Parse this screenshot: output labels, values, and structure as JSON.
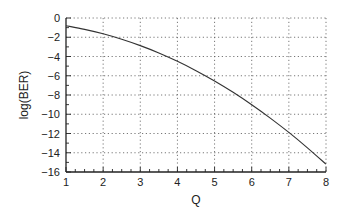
{
  "chart_data": {
    "type": "line",
    "title": "",
    "xlabel": "Q",
    "ylabel": "log(BER)",
    "xlim": [
      1,
      8
    ],
    "ylim": [
      -16,
      0
    ],
    "xticks": [
      1,
      2,
      3,
      4,
      5,
      6,
      7,
      8
    ],
    "yticks": [
      0,
      -2,
      -4,
      -6,
      -8,
      -10,
      -12,
      -14,
      -16
    ],
    "xtick_labels": [
      "1",
      "2",
      "3",
      "4",
      "5",
      "6",
      "7",
      "8"
    ],
    "ytick_labels": [
      "0",
      "−2",
      "−4",
      "−6",
      "−8",
      "−10",
      "−12",
      "−14",
      "−16"
    ],
    "grid": true,
    "grid_style": "dotted",
    "legend": null,
    "series": [
      {
        "name": "log(BER) vs Q",
        "color": "#333333",
        "x": [
          1,
          1.5,
          2,
          2.5,
          3,
          3.5,
          4,
          4.5,
          5,
          5.5,
          6,
          6.5,
          7,
          7.5,
          8
        ],
        "y": [
          -0.8,
          -1.18,
          -1.64,
          -2.21,
          -2.87,
          -3.63,
          -4.5,
          -5.47,
          -6.54,
          -7.72,
          -9.01,
          -10.4,
          -11.89,
          -13.49,
          -15.19
        ]
      }
    ]
  },
  "labels": {
    "xlabel": "Q",
    "ylabel": "log(BER)"
  }
}
